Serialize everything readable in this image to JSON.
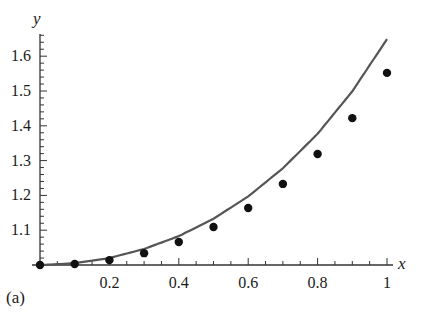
{
  "chart_data": {
    "type": "line",
    "title": "",
    "panel_label": "(a)",
    "xlabel": "x",
    "ylabel": "y",
    "xlim": [
      0,
      1
    ],
    "ylim": [
      1.0,
      1.66
    ],
    "grid": false,
    "legend": null,
    "x_ticks": [
      0.2,
      0.4,
      0.6,
      0.8,
      1
    ],
    "x_tick_labels": [
      "0.2",
      "0.4",
      "0.6",
      "0.8",
      "1"
    ],
    "y_ticks": [
      1.1,
      1.2,
      1.3,
      1.4,
      1.5,
      1.6
    ],
    "y_tick_labels": [
      "1.1",
      "1.2",
      "1.3",
      "1.4",
      "1.5",
      "1.6"
    ],
    "series": [
      {
        "name": "curve",
        "style": "line",
        "color": "#555555",
        "x": [
          0,
          0.1,
          0.2,
          0.3,
          0.4,
          0.5,
          0.6,
          0.7,
          0.8,
          0.9,
          1.0
        ],
        "values": [
          1.0,
          1.005,
          1.02,
          1.046,
          1.083,
          1.133,
          1.197,
          1.278,
          1.377,
          1.499,
          1.649
        ]
      },
      {
        "name": "points",
        "style": "scatter",
        "color": "#111111",
        "x": [
          0,
          0.1,
          0.2,
          0.3,
          0.4,
          0.5,
          0.6,
          0.7,
          0.8,
          0.9,
          1.0
        ],
        "values": [
          1.0,
          1.003,
          1.014,
          1.034,
          1.066,
          1.109,
          1.164,
          1.233,
          1.319,
          1.422,
          1.552
        ]
      }
    ]
  }
}
